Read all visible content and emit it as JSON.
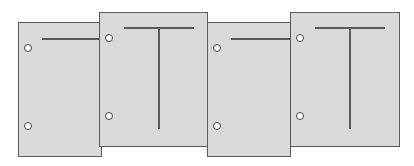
{
  "diagram": {
    "colors": {
      "background": "#ffffff",
      "page_fill": "#d9d9d9",
      "stroke": "#5a5a5a",
      "hole_fill": "#ffffff"
    },
    "pages": [
      {
        "id": "page-1",
        "position": "low",
        "mark": "horizontal-segment"
      },
      {
        "id": "page-2",
        "position": "high",
        "mark": "T"
      },
      {
        "id": "page-3",
        "position": "low",
        "mark": "horizontal-segment"
      },
      {
        "id": "page-4",
        "position": "high",
        "mark": "T"
      }
    ]
  }
}
